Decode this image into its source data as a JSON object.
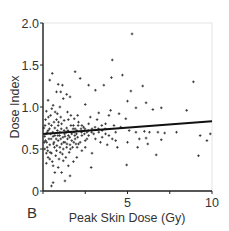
{
  "chart_data": {
    "type": "scatter",
    "panel_label": "B",
    "title": "",
    "xlabel": "Peak Skin Dose (Gy)",
    "ylabel": "Dose Index",
    "xlim": [
      0,
      10
    ],
    "ylim": [
      0,
      2.0
    ],
    "x_ticks": [
      0,
      2.5,
      5,
      7.5,
      10
    ],
    "x_tick_labels": [
      "",
      "",
      "5",
      "",
      "10"
    ],
    "y_ticks": [
      0,
      0.5,
      1.0,
      1.5,
      2.0
    ],
    "y_tick_labels": [
      "0",
      "0.5",
      "1.0",
      "1.5",
      "2.0"
    ],
    "grid": false,
    "legend": null,
    "series": [
      {
        "name": "observations",
        "marker": "+",
        "color": "#333333",
        "points": [
          [
            5.27,
            1.87
          ],
          [
            4.1,
            1.56
          ],
          [
            1.9,
            1.42
          ],
          [
            0.55,
            1.4
          ],
          [
            4.7,
            1.38
          ],
          [
            4.05,
            1.35
          ],
          [
            2.2,
            1.34
          ],
          [
            0.4,
            1.32
          ],
          [
            8.9,
            1.3
          ],
          [
            0.9,
            1.27
          ],
          [
            1.15,
            1.26
          ],
          [
            2.7,
            1.26
          ],
          [
            3.6,
            1.26
          ],
          [
            5.9,
            1.25
          ],
          [
            3.1,
            1.2
          ],
          [
            5.2,
            1.19
          ],
          [
            1.05,
            1.18
          ],
          [
            0.8,
            1.18
          ],
          [
            1.4,
            1.15
          ],
          [
            1.6,
            1.12
          ],
          [
            1.2,
            1.1
          ],
          [
            0.3,
            1.08
          ],
          [
            5.0,
            1.07
          ],
          [
            6.1,
            1.05
          ],
          [
            2.5,
            1.03
          ],
          [
            0.6,
            1.02
          ],
          [
            1.0,
            1.0
          ],
          [
            5.5,
            0.99
          ],
          [
            7.0,
            0.99
          ],
          [
            6.5,
            0.97
          ],
          [
            8.5,
            0.96
          ],
          [
            4.0,
            0.96
          ],
          [
            3.3,
            0.93
          ],
          [
            4.5,
            0.92
          ],
          [
            3.9,
            0.9
          ],
          [
            2.8,
            0.88
          ],
          [
            4.9,
            0.86
          ],
          [
            5.1,
            0.72
          ],
          [
            5.5,
            0.7
          ],
          [
            6.0,
            0.71
          ],
          [
            6.3,
            0.7
          ],
          [
            6.8,
            0.7
          ],
          [
            7.2,
            0.69
          ],
          [
            7.9,
            0.7
          ],
          [
            9.3,
            0.66
          ],
          [
            9.9,
            0.68
          ],
          [
            9.7,
            0.6
          ],
          [
            7.0,
            0.61
          ],
          [
            6.1,
            0.63
          ],
          [
            5.7,
            0.62
          ],
          [
            5.0,
            0.58
          ],
          [
            5.6,
            0.52
          ],
          [
            6.2,
            0.56
          ],
          [
            6.7,
            0.43
          ],
          [
            9.2,
            0.42
          ],
          [
            4.95,
            0.31
          ],
          [
            2.85,
            0.28
          ],
          [
            1.6,
            0.18
          ],
          [
            1.3,
            0.12
          ],
          [
            0.6,
            0.1
          ],
          [
            0.5,
            0.06
          ],
          [
            1.1,
            0.22
          ],
          [
            0.7,
            0.22
          ],
          [
            3.2,
            0.85
          ],
          [
            3.7,
            0.8
          ],
          [
            4.2,
            0.78
          ],
          [
            4.6,
            0.76
          ],
          [
            4.3,
            0.7
          ],
          [
            3.5,
            0.72
          ],
          [
            3.0,
            0.68
          ],
          [
            2.6,
            0.62
          ],
          [
            3.4,
            0.58
          ],
          [
            3.8,
            0.55
          ],
          [
            4.4,
            0.52
          ],
          [
            2.3,
            0.48
          ],
          [
            2.9,
            0.45
          ],
          [
            2.0,
            0.4
          ],
          [
            1.8,
            0.35
          ],
          [
            1.5,
            0.3
          ],
          [
            0.9,
            0.28
          ],
          [
            0.2,
            0.33
          ],
          [
            0.1,
            0.5
          ],
          [
            0.15,
            0.6
          ],
          [
            0.25,
            0.7
          ],
          [
            0.35,
            0.8
          ],
          [
            0.45,
            0.9
          ],
          [
            0.05,
            0.75
          ],
          [
            0.2,
            0.95
          ],
          [
            0.4,
            0.55
          ],
          [
            0.5,
            0.45
          ],
          [
            0.6,
            0.65
          ],
          [
            0.7,
            0.75
          ],
          [
            0.8,
            0.85
          ],
          [
            0.9,
            0.6
          ],
          [
            1.0,
            0.7
          ],
          [
            1.1,
            0.8
          ],
          [
            1.2,
            0.5
          ],
          [
            1.3,
            0.65
          ],
          [
            1.4,
            0.75
          ],
          [
            1.5,
            0.85
          ],
          [
            1.6,
            0.55
          ],
          [
            1.7,
            0.68
          ],
          [
            1.8,
            0.78
          ],
          [
            1.9,
            0.62
          ],
          [
            2.0,
            0.72
          ],
          [
            2.1,
            0.82
          ],
          [
            2.2,
            0.58
          ],
          [
            2.3,
            0.66
          ],
          [
            2.4,
            0.76
          ],
          [
            2.5,
            0.52
          ],
          [
            2.6,
            0.7
          ],
          [
            2.7,
            0.8
          ],
          [
            0.3,
            0.4
          ],
          [
            0.55,
            0.35
          ],
          [
            0.75,
            0.42
          ],
          [
            0.95,
            0.38
          ],
          [
            1.15,
            0.44
          ],
          [
            1.35,
            0.4
          ],
          [
            1.55,
            0.46
          ],
          [
            1.75,
            0.52
          ],
          [
            1.95,
            0.56
          ],
          [
            0.15,
            0.85
          ],
          [
            0.35,
            0.62
          ],
          [
            0.65,
            0.58
          ],
          [
            0.85,
            0.72
          ],
          [
            1.05,
            0.62
          ],
          [
            1.25,
            0.72
          ],
          [
            1.45,
            0.62
          ],
          [
            1.65,
            0.78
          ],
          [
            1.85,
            0.7
          ],
          [
            2.05,
            0.64
          ],
          [
            2.25,
            0.74
          ],
          [
            2.45,
            0.68
          ],
          [
            0.25,
            0.52
          ],
          [
            0.45,
            0.68
          ],
          [
            0.65,
            0.82
          ],
          [
            0.85,
            0.92
          ],
          [
            1.05,
            0.88
          ],
          [
            1.25,
            0.84
          ],
          [
            1.45,
            0.94
          ],
          [
            1.65,
            0.9
          ],
          [
            1.85,
            0.86
          ],
          [
            2.05,
            0.9
          ],
          [
            0.1,
            0.65
          ],
          [
            0.3,
            0.72
          ],
          [
            0.5,
            0.78
          ],
          [
            0.7,
            0.66
          ],
          [
            0.9,
            0.78
          ],
          [
            1.1,
            0.56
          ],
          [
            1.3,
            0.58
          ],
          [
            1.5,
            0.66
          ],
          [
            1.7,
            0.6
          ],
          [
            1.9,
            0.74
          ],
          [
            2.1,
            0.56
          ],
          [
            2.3,
            0.78
          ],
          [
            2.5,
            0.6
          ],
          [
            2.7,
            0.66
          ],
          [
            2.9,
            0.74
          ],
          [
            3.1,
            0.62
          ],
          [
            3.3,
            0.7
          ],
          [
            3.5,
            0.64
          ],
          [
            3.7,
            0.68
          ],
          [
            3.9,
            0.66
          ],
          [
            4.1,
            0.62
          ],
          [
            4.3,
            0.6
          ],
          [
            0.2,
            0.45
          ],
          [
            0.4,
            0.38
          ],
          [
            0.6,
            0.3
          ],
          [
            0.8,
            0.48
          ],
          [
            1.0,
            0.52
          ],
          [
            1.2,
            0.36
          ],
          [
            1.4,
            0.52
          ],
          [
            0.12,
            0.78
          ],
          [
            0.32,
            0.88
          ],
          [
            0.52,
            0.98
          ],
          [
            0.72,
            0.94
          ],
          [
            0.92,
            0.82
          ],
          [
            0.08,
            0.58
          ],
          [
            0.28,
            0.48
          ],
          [
            0.48,
            0.62
          ],
          [
            0.68,
            0.52
          ],
          [
            0.88,
            0.66
          ],
          [
            1.08,
            0.74
          ],
          [
            1.28,
            0.68
          ],
          [
            1.48,
            0.72
          ],
          [
            1.68,
            0.7
          ],
          [
            1.88,
            0.66
          ],
          [
            2.08,
            0.78
          ],
          [
            2.28,
            0.7
          ],
          [
            2.48,
            0.74
          ],
          [
            2.68,
            0.72
          ],
          [
            2.88,
            0.7
          ],
          [
            3.08,
            0.76
          ],
          [
            3.28,
            0.74
          ],
          [
            3.48,
            0.78
          ],
          [
            3.68,
            0.74
          ],
          [
            0.18,
            0.68
          ],
          [
            0.38,
            0.74
          ],
          [
            0.58,
            0.7
          ],
          [
            0.78,
            0.62
          ],
          [
            0.98,
            0.66
          ],
          [
            1.18,
            0.64
          ],
          [
            1.38,
            0.7
          ],
          [
            1.58,
            0.64
          ],
          [
            1.78,
            0.74
          ],
          [
            1.98,
            0.68
          ],
          [
            0.22,
            0.58
          ],
          [
            0.42,
            0.46
          ],
          [
            0.62,
            0.56
          ],
          [
            0.82,
            0.54
          ],
          [
            1.02,
            0.46
          ],
          [
            1.22,
            0.58
          ],
          [
            1.42,
            0.56
          ],
          [
            1.62,
            0.5
          ],
          [
            1.82,
            0.58
          ],
          [
            2.02,
            0.52
          ]
        ]
      }
    ],
    "fit_line": {
      "name": "linear regression",
      "x": [
        0,
        10
      ],
      "y": [
        0.68,
        0.83
      ],
      "color": "#111111",
      "width": 2
    }
  }
}
